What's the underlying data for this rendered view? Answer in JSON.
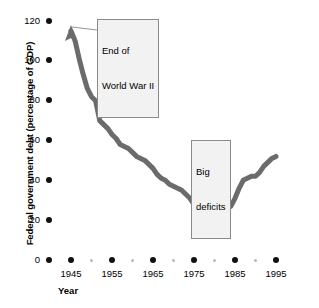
{
  "chart_data": {
    "type": "line",
    "title": "",
    "xlabel": "Year",
    "ylabel": "Federal government debt (percentage of GDP)",
    "xlim": [
      1943,
      1996
    ],
    "ylim": [
      0,
      120
    ],
    "grid": false,
    "legend": "none",
    "line_color": "#6b6b6b",
    "x_ticks": [
      "1945",
      "1955",
      "1965",
      "1975",
      "1985",
      "1995"
    ],
    "x_minor_ticks": [
      "1950",
      "1960",
      "1970",
      "1980",
      "1990"
    ],
    "y_ticks": [
      "0",
      "20",
      "40",
      "60",
      "80",
      "100",
      "120"
    ],
    "series": [
      {
        "name": "Federal government debt",
        "x": [
          1945,
          1946,
          1947,
          1948,
          1949,
          1950,
          1951,
          1952,
          1953,
          1954,
          1955,
          1956,
          1957,
          1958,
          1959,
          1960,
          1961,
          1962,
          1963,
          1964,
          1965,
          1966,
          1967,
          1968,
          1969,
          1970,
          1971,
          1972,
          1973,
          1974,
          1975,
          1976,
          1977,
          1978,
          1979,
          1980,
          1981,
          1982,
          1983,
          1984,
          1985,
          1986,
          1987,
          1988,
          1989,
          1990,
          1991,
          1992,
          1993,
          1994,
          1995
        ],
        "values": [
          115,
          110,
          101,
          93,
          86,
          82,
          80,
          70,
          68,
          66,
          63,
          61,
          58,
          57,
          56,
          54,
          52,
          51,
          50,
          48,
          46,
          43,
          41,
          40,
          38,
          37,
          36,
          35,
          33,
          31,
          28,
          27,
          26,
          25,
          24,
          25,
          27,
          26,
          26,
          27,
          31,
          36,
          40,
          41,
          42,
          42,
          44,
          47,
          49,
          51,
          52
        ],
        "annotation_points": {
          "arrow_tip": {
            "x": 1945,
            "y": 118
          },
          "big_deficits": {
            "x": 1981,
            "y": 27
          }
        }
      }
    ],
    "annotations": [
      {
        "id": "end-of-wwii",
        "text": "End of\nWorld War II",
        "line1": "End of",
        "line2": "World War II"
      },
      {
        "id": "big-deficits",
        "text": "Big\ndeficits",
        "line1": "Big",
        "line2": "deficits"
      }
    ]
  }
}
